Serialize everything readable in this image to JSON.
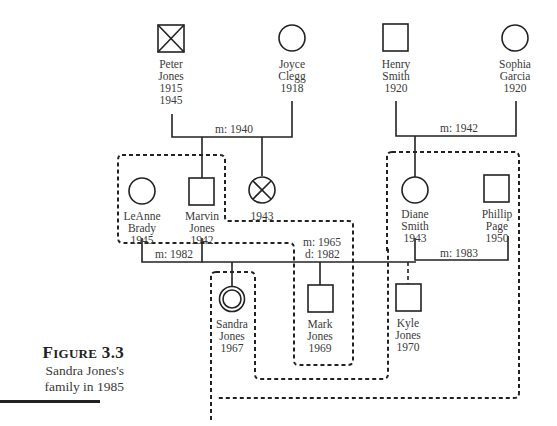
{
  "figure": {
    "label_prefix": "F",
    "label_rest": "IGURE",
    "number": "3.3",
    "caption_line1": "Sandra Jones's",
    "caption_line2": "family in 1985"
  },
  "people": {
    "peter": {
      "name1": "Peter",
      "name2": "Jones",
      "born": "1915",
      "died": "1945",
      "sex": "male",
      "status": "deceased"
    },
    "joyce": {
      "name1": "Joyce",
      "name2": "Clegg",
      "born": "1918",
      "sex": "female"
    },
    "henry": {
      "name1": "Henry",
      "name2": "Smith",
      "born": "1920",
      "sex": "male"
    },
    "sophia": {
      "name1": "Sophia",
      "name2": "Garcia",
      "born": "1920",
      "sex": "female"
    },
    "leanne": {
      "name1": "LeAnne",
      "name2": "Brady",
      "born": "1945",
      "sex": "female"
    },
    "marvin": {
      "name1": "Marvin",
      "name2": "Jones",
      "born": "1942",
      "sex": "male"
    },
    "unnamed": {
      "born": "1943",
      "sex": "female",
      "status": "deceased"
    },
    "diane": {
      "name1": "Diane",
      "name2": "Smith",
      "born": "1943",
      "sex": "female"
    },
    "phillip": {
      "name1": "Phillip",
      "name2": "Page",
      "born": "1950",
      "sex": "male"
    },
    "sandra": {
      "name1": "Sandra",
      "name2": "Jones",
      "born": "1967",
      "sex": "female",
      "status": "index person"
    },
    "mark": {
      "name1": "Mark",
      "name2": "Jones",
      "born": "1969",
      "sex": "male"
    },
    "kyle": {
      "name1": "Kyle",
      "name2": "Jones",
      "born": "1970",
      "sex": "male"
    }
  },
  "relationships": {
    "peter_joyce": {
      "label": "m: 1940"
    },
    "henry_sophia": {
      "label": "m: 1942"
    },
    "leanne_marvin": {
      "label": "m: 1982"
    },
    "marvin_diane": {
      "label1": "m: 1965",
      "label2": "d: 1982"
    },
    "diane_phillip": {
      "label": "m: 1983"
    }
  },
  "households": [
    {
      "name": "Marvin household",
      "members": [
        "LeAnne Brady",
        "Marvin Jones",
        "Mark Jones"
      ]
    },
    {
      "name": "Sandra household",
      "members": [
        "Sandra Jones"
      ]
    },
    {
      "name": "Diane household",
      "members": [
        "Diane Smith",
        "Phillip Page",
        "Kyle Jones"
      ]
    }
  ],
  "colors": {
    "line": "#222222",
    "text": "#3a3a3a",
    "background": "#ffffff"
  }
}
